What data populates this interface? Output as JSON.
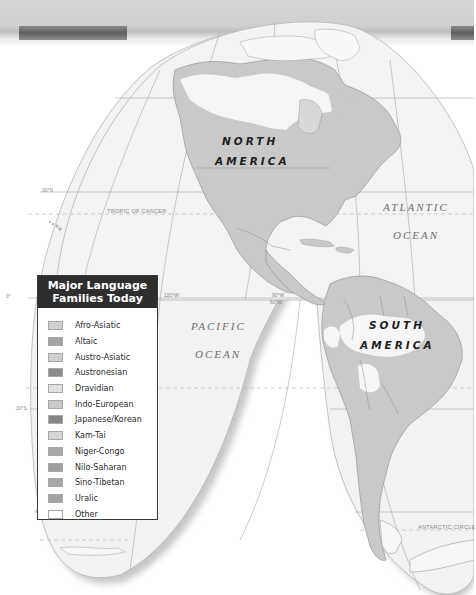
{
  "header": {
    "band_color": "#d3d3d3",
    "stripe_dark_color": "#6a6a6a"
  },
  "map": {
    "projection": "interrupted homolosine (Americas lobes)",
    "continents": [
      {
        "line1": "NORTH",
        "line2": "AMERICA"
      },
      {
        "line1": "SOUTH",
        "line2": "AMERICA"
      }
    ],
    "oceans": [
      {
        "line1": "ATLANTIC",
        "line2": "OCEAN"
      },
      {
        "line1": "PACIFIC",
        "line2": "OCEAN"
      }
    ],
    "reference_lines": {
      "tropic_of_cancer": "TROPIC OF CANCER",
      "antarctic_circle": "ANTARCTIC CIRCLE"
    },
    "grid_labels": {
      "lat_30n": "30°N",
      "lat_0": "0°",
      "lat_30s": "30°S",
      "lat_60s": "60°S",
      "lon_120w": "120°W",
      "lon_90w": "90°W",
      "lon_60w": "60°W"
    },
    "colors": {
      "ocean": "#f3f3f3",
      "land_indo_european": "#c9c9c9",
      "land_other": "#f7f7f7",
      "border": "#8c8c8c",
      "graticule": "#a8a8a8"
    }
  },
  "legend": {
    "title_line1": "Major Language",
    "title_line2": "Families Today",
    "items": [
      {
        "label": "Afro-Asiatic",
        "color": "#d0d0d0"
      },
      {
        "label": "Altaic",
        "color": "#a4a4a4"
      },
      {
        "label": "Austro-Asiatic",
        "color": "#cdcdcd"
      },
      {
        "label": "Austronesian",
        "color": "#8c8c8c"
      },
      {
        "label": "Dravidian",
        "color": "#e0e0e0"
      },
      {
        "label": "Indo-European",
        "color": "#c9c9c9"
      },
      {
        "label": "Japanese/Korean",
        "color": "#858585"
      },
      {
        "label": "Kam-Tai",
        "color": "#d4d4d4"
      },
      {
        "label": "Niger-Congo",
        "color": "#a9a9a9"
      },
      {
        "label": "Nilo-Saharan",
        "color": "#9e9e9e"
      },
      {
        "label": "Sino-Tibetan",
        "color": "#a6a6a6"
      },
      {
        "label": "Uralic",
        "color": "#a2a2a2"
      },
      {
        "label": "Other",
        "color": "#ffffff"
      }
    ]
  }
}
